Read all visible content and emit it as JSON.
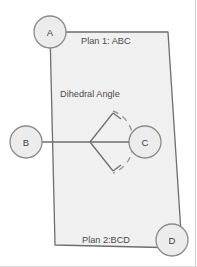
{
  "figure": {
    "labels": {
      "plan1": "Plan 1: ABC",
      "plan2": "Plan 2:BCD",
      "angle": "Dihedral Angle"
    },
    "nodes": [
      {
        "id": "A",
        "label": "A",
        "cx": 50,
        "cy": 32,
        "r": 16
      },
      {
        "id": "B",
        "label": "B",
        "cx": 26,
        "cy": 142,
        "r": 16
      },
      {
        "id": "C",
        "label": "C",
        "cx": 145,
        "cy": 142,
        "r": 16
      },
      {
        "id": "D",
        "label": "D",
        "cx": 172,
        "cy": 240,
        "r": 16
      }
    ],
    "quad_points": "50,32 168,32 182,248 55,245",
    "edge_bc": {
      "x1": 26,
      "y1": 142,
      "x2": 145,
      "y2": 142
    },
    "angle_arms": {
      "vertex": {
        "x": 90,
        "y": 142
      },
      "upper_end": {
        "x": 113,
        "y": 113
      },
      "lower_end": {
        "x": 113,
        "y": 171
      }
    },
    "colors": {
      "plane_fill": "#f0f0f0",
      "plane_stroke": "#6e6e6e",
      "node_fill": "#ececec",
      "node_stroke": "#8a8a8a",
      "line": "#6e6e6e",
      "dashed": "#9a9a9a",
      "text": "#4a4a4a",
      "border": "#c9c9c9",
      "background": "#ffffff"
    }
  }
}
